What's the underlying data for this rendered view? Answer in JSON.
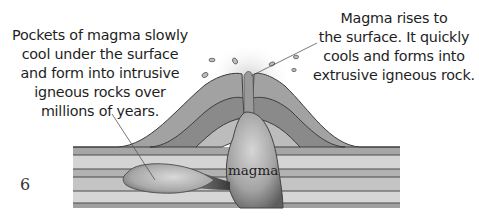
{
  "figure": {
    "type": "diagram",
    "captions": {
      "intrusive": {
        "lines": [
          "Pockets of magma slowly",
          "cool under the surface",
          "and form into intrusive",
          "igneous rocks over",
          "millions of years."
        ]
      },
      "extrusive": {
        "lines": [
          "Magma rises to",
          "the surface. It quickly",
          "cools and forms into",
          "extrusive igneous rock."
        ]
      }
    },
    "labels": {
      "magma": "magma"
    },
    "page_number": "6",
    "colors": {
      "strata_light": "#d2d2d2",
      "strata_mid": "#b4b4b4",
      "strata_dark": "#8c8c8c",
      "volcano_outer": "#9a9a9a",
      "volcano_mid": "#858585",
      "volcano_inner": "#bdbdbd",
      "magma_light": "#c8c8c8",
      "magma_dark": "#5a5a5a",
      "outline": "#3c3c3c"
    }
  }
}
